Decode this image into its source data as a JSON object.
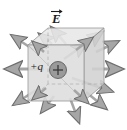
{
  "figure": {
    "kind": "physics-diagram",
    "labels": {
      "field_label": "E",
      "field_label_accent": "vector-arrow",
      "charge_label": "+q",
      "charge_sign": "+"
    },
    "colors": {
      "face_light": "#e8e8e8",
      "face_mid": "#dedede",
      "face_dark": "#d2d2d2",
      "edge": "#8a8a8a",
      "hidden_edge": "#a8a8a8",
      "arrow_fill": "#a6a6a6",
      "arrow_edge": "#6e6e6e",
      "charge_fill": "#9a9a9a",
      "charge_edge": "#5e5e5e",
      "text": "#1a1a1a",
      "background": "#ffffff"
    },
    "cube": {
      "front_face": "28,45 84,45 84,101 28,101",
      "top_face": "28,45 48,28 104,28 84,45",
      "right_face": "84,45 104,28 104,84 84,101",
      "hidden_edges": [
        "28,101 48,84 104,84",
        "48,84 48,28"
      ]
    },
    "charge": {
      "cx": 58,
      "cy": 70,
      "r": 8.5
    },
    "field_arrows": [
      {
        "name": "arrow-left",
        "x1": 42,
        "y1": 69,
        "x2": 4,
        "y2": 69
      },
      {
        "name": "arrow-right",
        "x1": 96,
        "y1": 69,
        "x2": 124,
        "y2": 69
      },
      {
        "name": "arrow-up-left-outer",
        "x1": 34,
        "y1": 50,
        "x2": 10,
        "y2": 34
      },
      {
        "name": "arrow-up-left-inner",
        "x1": 52,
        "y1": 44,
        "x2": 38,
        "y2": 33
      },
      {
        "name": "arrow-up-mid",
        "x1": 66,
        "y1": 44,
        "x2": 50,
        "y2": 26
      },
      {
        "name": "arrow-up-right-inner",
        "x1": 86,
        "y1": 44,
        "x2": 104,
        "y2": 31
      },
      {
        "name": "arrow-up-right-outer",
        "x1": 96,
        "y1": 52,
        "x2": 120,
        "y2": 40
      },
      {
        "name": "arrow-top-face-near",
        "x1": 66,
        "y1": 58,
        "x2": 88,
        "y2": 42
      },
      {
        "name": "arrow-down-left-outer",
        "x1": 36,
        "y1": 90,
        "x2": 12,
        "y2": 106
      },
      {
        "name": "arrow-down-left-inner",
        "x1": 54,
        "y1": 96,
        "x2": 40,
        "y2": 114
      },
      {
        "name": "arrow-down-mid",
        "x1": 70,
        "y1": 98,
        "x2": 80,
        "y2": 124
      },
      {
        "name": "arrow-down-right",
        "x1": 86,
        "y1": 92,
        "x2": 108,
        "y2": 110
      },
      {
        "name": "arrow-back-right",
        "x1": 72,
        "y1": 78,
        "x2": 114,
        "y2": 92
      }
    ]
  }
}
